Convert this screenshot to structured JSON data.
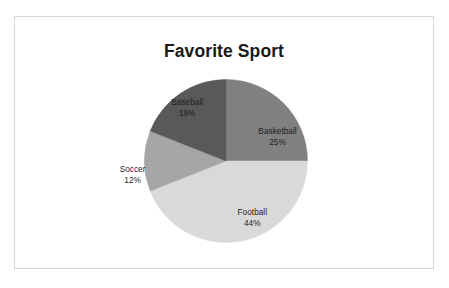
{
  "chart_data": {
    "type": "pie",
    "title": "Favorite Sport",
    "xlabel": "",
    "ylabel": "",
    "grid": false,
    "legend": "none",
    "label_format": "name + percent inside slice",
    "start_angle_deg": 0,
    "direction": "clockwise",
    "categories": [
      "Basketball",
      "Football",
      "Soccer",
      "Baseball"
    ],
    "values": [
      25,
      44,
      12,
      19
    ],
    "slices": [
      {
        "name": "Basketball",
        "percent": 25,
        "percent_label": "25%",
        "color": "#808080",
        "start_deg": 0,
        "end_deg": 90,
        "label_x_pct": 62.5,
        "label_y_pct": 47.5
      },
      {
        "name": "Football",
        "percent": 44,
        "percent_label": "44%",
        "color": "#d9d9d9",
        "start_deg": 90,
        "end_deg": 248.4,
        "label_x_pct": 56.5,
        "label_y_pct": 79.5
      },
      {
        "name": "Soccer",
        "percent": 12,
        "percent_label": "12%",
        "color": "#a6a6a6",
        "start_deg": 248.4,
        "end_deg": 291.6,
        "label_x_pct": 28.0,
        "label_y_pct": 62.5
      },
      {
        "name": "Baseball",
        "percent": 19,
        "percent_label": "19%",
        "color": "#595959",
        "start_deg": 291.6,
        "end_deg": 360,
        "label_x_pct": 41.0,
        "label_y_pct": 36.0
      }
    ]
  },
  "colors": {
    "frame_border": "#d6d6d6",
    "background": "#ffffff",
    "title_text": "#1a1a1a",
    "label_text": "#1f1f1f"
  }
}
